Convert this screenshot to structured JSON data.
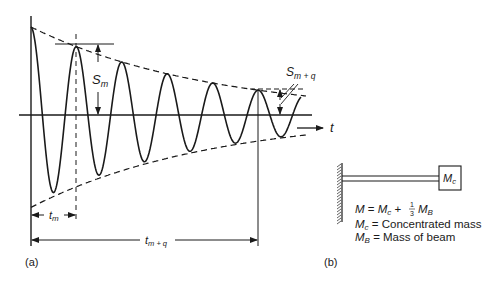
{
  "panel_a": {
    "label": "(a)",
    "axis_time_label": "t",
    "s_m": {
      "main": "S",
      "sub": "m"
    },
    "s_mq": {
      "main": "S",
      "sub": "m + q"
    },
    "t_m": {
      "main": "t",
      "sub": "m"
    },
    "t_mq": {
      "main": "t",
      "sub": "m + q"
    },
    "wave": {
      "x_start": 31,
      "x_end": 301,
      "zero_y": 115,
      "period": 45.5,
      "amp_start": 88,
      "amp_end": 25,
      "decay_length": 226
    }
  },
  "panel_b": {
    "label": "(b)",
    "mass_box_label": {
      "main": "M",
      "sub": "c"
    },
    "formula": {
      "lhs": "M",
      "eq": " = ",
      "mc": "M",
      "mc_sub": "c",
      "plus": " + ",
      "frac_num": "1",
      "frac_den": "3",
      "mb": "M",
      "mb_sub": "B"
    },
    "legend": [
      {
        "sym": "M",
        "sub": "c",
        "text": " = Concentrated mass"
      },
      {
        "sym": "M",
        "sub": "B",
        "text": " = Mass of beam"
      }
    ]
  },
  "colors": {
    "ink": "#1a1a1a",
    "background": "#ffffff"
  }
}
